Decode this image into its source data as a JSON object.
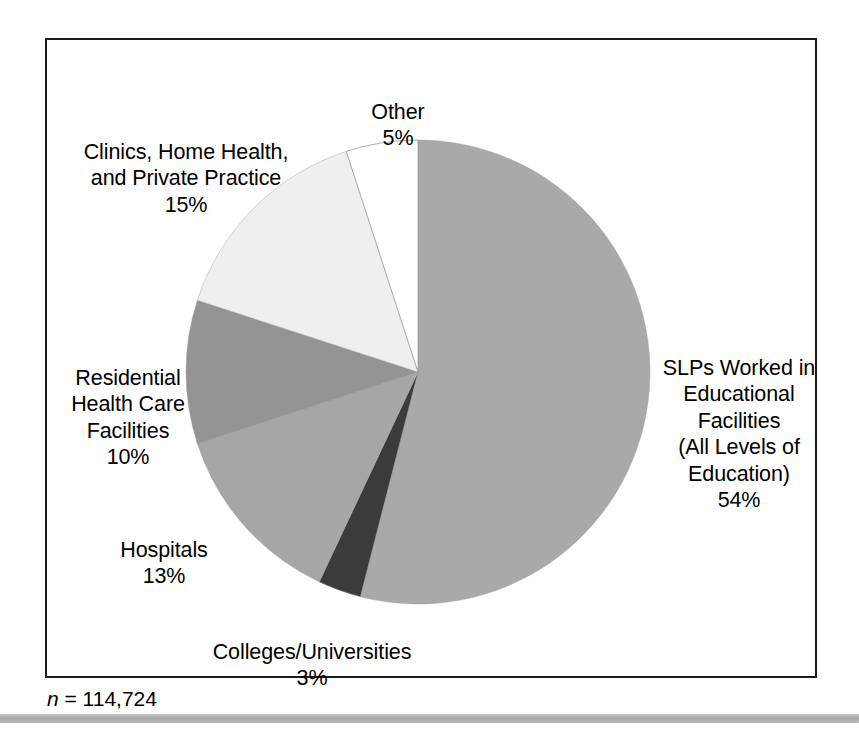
{
  "figure": {
    "footnote_prefix": "n",
    "footnote_rest": " = 114,724",
    "footnote_full": "n = 114,724"
  },
  "chart_data": {
    "type": "pie",
    "title": "",
    "subtitle": "",
    "xlabel": "",
    "ylabel": "",
    "legend_position": "none",
    "grid": false,
    "total_label": "n = 114,724",
    "total_value": 114724,
    "units": "percent",
    "start_angle_deg": 0,
    "direction": "clockwise",
    "categories": [
      "SLPs Worked in Educational Facilities (All Levels of Education)",
      "Colleges/Universities",
      "Hospitals",
      "Residential Health Care Facilities",
      "Clinics, Home Health, and Private Practice",
      "Other"
    ],
    "values": [
      54,
      3,
      13,
      10,
      15,
      5
    ],
    "slices": [
      {
        "key": "slps-educational",
        "label_lines": [
          "SLPs Worked in",
          "Educational",
          "Facilities",
          "(All Levels of",
          "Education)"
        ],
        "label_text": "SLPs Worked in\nEducational\nFacilities\n(All Levels of\nEducation)",
        "percent_text": "54%",
        "value": 54,
        "color": "#a9a9a9"
      },
      {
        "key": "colleges-universities",
        "label_lines": [
          "Colleges/Universities"
        ],
        "label_text": "Colleges/Universities",
        "percent_text": "3%",
        "value": 3,
        "color": "#3b3b3b"
      },
      {
        "key": "hospitals",
        "label_lines": [
          "Hospitals"
        ],
        "label_text": "Hospitals",
        "percent_text": "13%",
        "value": 13,
        "color": "#a6a6a6"
      },
      {
        "key": "residential-health-care",
        "label_lines": [
          "Residential",
          "Health Care",
          "Facilities"
        ],
        "label_text": "Residential\nHealth Care\nFacilities",
        "percent_text": "10%",
        "value": 10,
        "color": "#949494"
      },
      {
        "key": "clinics-home-health-private-practice",
        "label_lines": [
          "Clinics, Home Health,",
          "and Private Practice"
        ],
        "label_text": "Clinics, Home Health,\nand Private Practice",
        "percent_text": "15%",
        "value": 15,
        "color": "#efefef"
      },
      {
        "key": "other",
        "label_lines": [
          "Other"
        ],
        "label_text": "Other",
        "percent_text": "5%",
        "value": 5,
        "color": "#ffffff"
      }
    ],
    "geometry": {
      "center_x": 418,
      "center_y": 372,
      "radius": 232
    },
    "frame_color": "#1a1a1a",
    "background_color": "#ffffff"
  }
}
